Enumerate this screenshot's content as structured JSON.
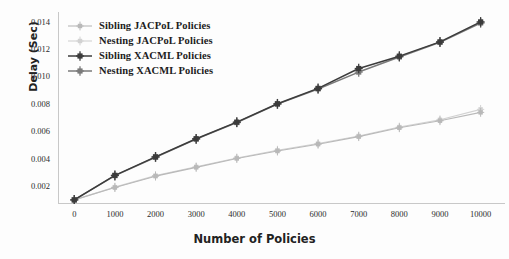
{
  "chart_data": {
    "type": "line",
    "title": "",
    "xlabel": "Number of Policies",
    "ylabel": "Delay (Sec)",
    "x": [
      0,
      1000,
      2000,
      3000,
      4000,
      5000,
      6000,
      7000,
      8000,
      9000,
      10000
    ],
    "xlim": [
      -400,
      10600
    ],
    "ylim": [
      0.0007,
      0.0147
    ],
    "xticks": [
      "0",
      "1000",
      "2000",
      "3000",
      "4000",
      "5000",
      "6000",
      "7000",
      "8000",
      "9000",
      "10000"
    ],
    "xtick_values": [
      0,
      1000,
      2000,
      3000,
      4000,
      5000,
      6000,
      7000,
      8000,
      9000,
      10000
    ],
    "yticks": [
      "0.002",
      "0.004",
      "0.006",
      "0.008",
      "0.010",
      "0.012",
      "0.014"
    ],
    "ytick_values": [
      0.002,
      0.004,
      0.006,
      0.008,
      0.01,
      0.012,
      0.014
    ],
    "grid": false,
    "legend_position": "upper left",
    "marker": "plus-square",
    "series": [
      {
        "name": "Sibling JACPoL Policies",
        "color": "#b9b9b9",
        "width": 1.1,
        "values": [
          0.001,
          0.0019,
          0.00273,
          0.00337,
          0.00402,
          0.00456,
          0.00506,
          0.00561,
          0.00626,
          0.00677,
          0.00738
        ]
      },
      {
        "name": "Nesting JACPoL Policies",
        "color": "#d2d2d2",
        "width": 1.1,
        "values": [
          0.001,
          0.00193,
          0.00277,
          0.00341,
          0.00406,
          0.00462,
          0.00511,
          0.00566,
          0.00631,
          0.00684,
          0.0076
        ]
      },
      {
        "name": "Sibling XACML Policies",
        "color": "#3c3c3c",
        "width": 1.5,
        "values": [
          0.001,
          0.00279,
          0.00414,
          0.00546,
          0.00667,
          0.00801,
          0.00913,
          0.01058,
          0.01148,
          0.01252,
          0.01398
        ]
      },
      {
        "name": "Nesting XACML Policies",
        "color": "#7a7a7a",
        "width": 1.5,
        "values": [
          0.001,
          0.00277,
          0.00411,
          0.00543,
          0.00664,
          0.00798,
          0.00909,
          0.01032,
          0.01142,
          0.01249,
          0.0139
        ]
      }
    ]
  },
  "legend": {
    "items": [
      {
        "label": "Sibling JACPoL Policies"
      },
      {
        "label": "Nesting JACPoL Policies"
      },
      {
        "label": "Sibling XACML Policies"
      },
      {
        "label": "Nesting XACML Policies"
      }
    ]
  },
  "axes": {
    "x_title": "Number of Policies",
    "y_title": "Delay (Sec)",
    "axis_color": "#c8c8c8"
  }
}
